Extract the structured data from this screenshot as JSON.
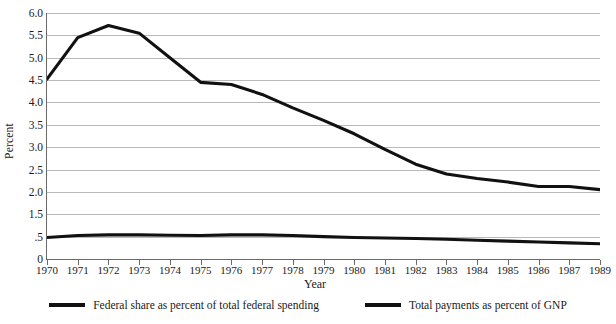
{
  "chart_data": {
    "type": "line",
    "title": "",
    "xlabel": "Year",
    "ylabel": "Percent",
    "grid": true,
    "legend_position": "bottom",
    "x": [
      1970,
      1971,
      1972,
      1973,
      1974,
      1975,
      1976,
      1977,
      1978,
      1979,
      1980,
      1981,
      1982,
      1983,
      1984,
      1985,
      1986,
      1987,
      1989
    ],
    "xtick_labels": [
      "1970",
      "1971",
      "1972",
      "1973",
      "1974",
      "1975",
      "1976",
      "1977",
      "1978",
      "1979",
      "1980",
      "1981",
      "1982",
      "1983",
      "1984",
      "1985",
      "1986",
      "1987",
      "1989"
    ],
    "ytick_labels": [
      "6.0",
      "5.5",
      "5.0",
      "4.5",
      "4.0",
      "3.5",
      "3.0",
      "2.5",
      "2.0",
      "1.5",
      ".5",
      "0"
    ],
    "ytick_values": [
      6.0,
      5.5,
      5.0,
      4.5,
      4.0,
      3.5,
      3.0,
      2.5,
      2.0,
      1.5,
      0.5,
      0.0
    ],
    "ylim": [
      0,
      6.0
    ],
    "series": [
      {
        "name": "Federal share as percent of total federal spending",
        "color": "#111111",
        "values": [
          4.52,
          5.45,
          5.72,
          5.55,
          5.0,
          4.45,
          4.4,
          4.18,
          3.88,
          3.6,
          3.3,
          2.95,
          2.62,
          2.4,
          2.3,
          2.22,
          2.12,
          2.12,
          2.05
        ]
      },
      {
        "name": "Total payments as percent of GNP",
        "color": "#111111",
        "values": [
          0.48,
          0.55,
          0.58,
          0.58,
          0.56,
          0.55,
          0.58,
          0.58,
          0.55,
          0.5,
          0.48,
          0.47,
          0.46,
          0.44,
          0.42,
          0.4,
          0.38,
          0.36,
          0.34
        ]
      }
    ]
  },
  "legend": {
    "items": [
      {
        "label": "Federal share as percent of total federal spending"
      },
      {
        "label": "Total payments as percent of GNP"
      }
    ]
  },
  "axes": {
    "y_title": "Percent",
    "x_title": "Year"
  }
}
